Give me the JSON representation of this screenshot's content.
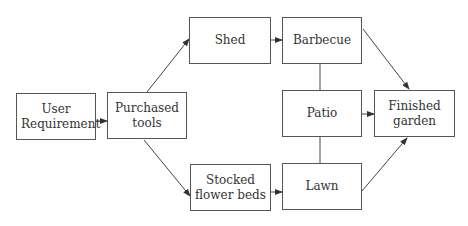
{
  "diagram": {
    "nodes": [
      {
        "id": "user_requirement",
        "label": "User Requirement"
      },
      {
        "id": "purchased_tools",
        "label": "Purchased tools"
      },
      {
        "id": "shed",
        "label": "Shed"
      },
      {
        "id": "barbecue",
        "label": "Barbecue"
      },
      {
        "id": "patio",
        "label": "Patio"
      },
      {
        "id": "stocked_flower_beds",
        "label": "Stocked flower beds"
      },
      {
        "id": "lawn",
        "label": "Lawn"
      },
      {
        "id": "finished_garden",
        "label": "Finished garden"
      }
    ],
    "edges": [
      {
        "from": "user_requirement",
        "to": "purchased_tools",
        "type": "arrow"
      },
      {
        "from": "purchased_tools",
        "to": "shed",
        "type": "arrow"
      },
      {
        "from": "purchased_tools",
        "to": "stocked_flower_beds",
        "type": "arrow"
      },
      {
        "from": "shed",
        "to": "barbecue",
        "type": "arrow"
      },
      {
        "from": "stocked_flower_beds",
        "to": "lawn",
        "type": "arrow"
      },
      {
        "from": "barbecue",
        "to": "patio",
        "type": "line"
      },
      {
        "from": "patio",
        "to": "lawn",
        "type": "line"
      },
      {
        "from": "barbecue",
        "to": "finished_garden",
        "type": "arrow"
      },
      {
        "from": "patio",
        "to": "finished_garden",
        "type": "arrow"
      },
      {
        "from": "lawn",
        "to": "finished_garden",
        "type": "arrow"
      }
    ],
    "colors": {
      "stroke": "#555555",
      "text": "#333333",
      "background": "#ffffff"
    }
  }
}
